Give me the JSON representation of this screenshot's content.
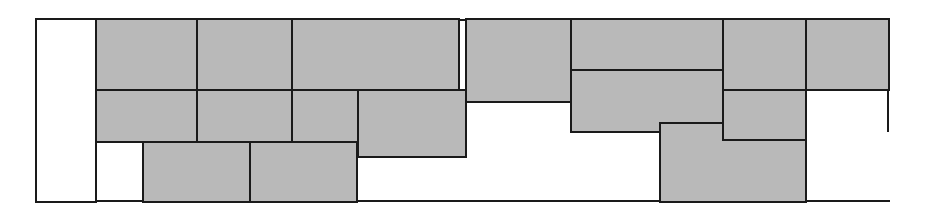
{
  "figure": {
    "type": "rectangle-packing-diagram",
    "title": "",
    "caption": "",
    "canvas": {
      "width": 928,
      "height": 212
    },
    "colors": {
      "block_fill": "#b9b9b9",
      "block_stroke": "#1a1a1a",
      "empty_fill": "#ffffff",
      "background": "#ffffff"
    },
    "stroke_width": 2.2
  },
  "container": {
    "label": "strip-container",
    "x": 36,
    "y": 19,
    "width": 854,
    "height": 183,
    "right": 890,
    "bottom": 202
  },
  "guide_lines": [
    {
      "name": "container-top-edge",
      "x1": 36,
      "y1": 19,
      "x2": 890,
      "y2": 19
    },
    {
      "name": "container-left-edge",
      "x1": 36,
      "y1": 19,
      "x2": 36,
      "y2": 202
    },
    {
      "name": "container-bottom-edge-left",
      "x1": 36,
      "y1": 202,
      "x2": 143,
      "y2": 202
    },
    {
      "name": "container-bottom-edge-mid",
      "x1": 143,
      "y1": 202,
      "x2": 660,
      "y2": 202
    },
    {
      "name": "container-bottom-edge-right",
      "x1": 660,
      "y1": 202,
      "x2": 890,
      "y2": 202
    },
    {
      "name": "container-right-edge",
      "x1": 889,
      "y1": 19,
      "x2": 889,
      "y2": 132
    }
  ],
  "blocks": [
    {
      "id": "empty-left-gap",
      "kind": "empty",
      "x": 36,
      "y": 19,
      "width": 60,
      "height": 183
    },
    {
      "id": "block-a1",
      "kind": "filled",
      "x": 96,
      "y": 19,
      "width": 101,
      "height": 71
    },
    {
      "id": "block-a2",
      "kind": "filled",
      "x": 197,
      "y": 19,
      "width": 95,
      "height": 71
    },
    {
      "id": "block-a3",
      "kind": "filled",
      "x": 292,
      "y": 19,
      "width": 167,
      "height": 71
    },
    {
      "id": "block-a4",
      "kind": "filled",
      "x": 466,
      "y": 19,
      "width": 105,
      "height": 83
    },
    {
      "id": "block-a5",
      "kind": "filled",
      "x": 571,
      "y": 19,
      "width": 152,
      "height": 51
    },
    {
      "id": "block-a6",
      "kind": "filled",
      "x": 723,
      "y": 19,
      "width": 83,
      "height": 71
    },
    {
      "id": "block-a7",
      "kind": "filled",
      "x": 806,
      "y": 19,
      "width": 83,
      "height": 71
    },
    {
      "id": "block-b1",
      "kind": "filled",
      "x": 96,
      "y": 90,
      "width": 101,
      "height": 52
    },
    {
      "id": "block-b2",
      "kind": "filled",
      "x": 197,
      "y": 90,
      "width": 95,
      "height": 52
    },
    {
      "id": "block-b3",
      "kind": "filled",
      "x": 292,
      "y": 90,
      "width": 66,
      "height": 67
    },
    {
      "id": "block-b4",
      "kind": "filled",
      "x": 358,
      "y": 90,
      "width": 108,
      "height": 67
    },
    {
      "id": "block-b5",
      "kind": "filled",
      "x": 571,
      "y": 70,
      "width": 152,
      "height": 62
    },
    {
      "id": "block-b6",
      "kind": "filled",
      "x": 723,
      "y": 90,
      "width": 83,
      "height": 70
    },
    {
      "id": "block-c1",
      "kind": "filled",
      "x": 143,
      "y": 142,
      "width": 107,
      "height": 60
    },
    {
      "id": "block-c2",
      "kind": "filled",
      "x": 250,
      "y": 142,
      "width": 107,
      "height": 60
    },
    {
      "id": "block-c3",
      "kind": "l-shape",
      "points": "660,123 723,123 723,140 806,140 806,202 660,202"
    }
  ],
  "chart_data": {
    "type": "table",
    "xlabel": "x position (px)",
    "ylabel": "y position (px)",
    "xlim": [
      36,
      890
    ],
    "ylim": [
      19,
      202
    ],
    "categories": [
      "block-a1",
      "block-a2",
      "block-a3",
      "block-a4",
      "block-a5",
      "block-a6",
      "block-a7",
      "block-b1",
      "block-b2",
      "block-b3",
      "block-b4",
      "block-b5",
      "block-b6",
      "block-c1",
      "block-c2",
      "block-c3"
    ],
    "series": [
      {
        "name": "width",
        "values": [
          101,
          95,
          167,
          105,
          152,
          83,
          83,
          101,
          95,
          66,
          108,
          152,
          83,
          107,
          107,
          146
        ]
      },
      {
        "name": "height",
        "values": [
          71,
          71,
          71,
          83,
          51,
          71,
          71,
          52,
          52,
          67,
          67,
          62,
          70,
          60,
          60,
          79
        ]
      }
    ],
    "legend": [],
    "grid": false
  }
}
